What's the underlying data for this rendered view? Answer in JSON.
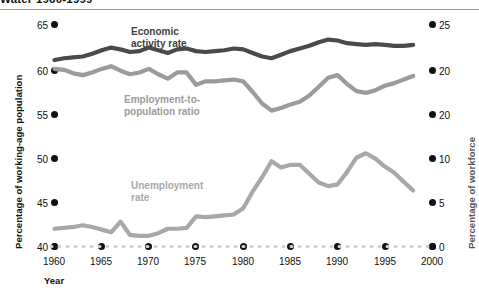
{
  "title": "Water 1960-1999",
  "axes": {
    "left_title": "Percentage of working-age population",
    "right_title": "Percentage of workforce",
    "x_title": "Year",
    "left_ticks": [
      "65",
      "60",
      "55",
      "50",
      "45",
      "40"
    ],
    "right_ticks": [
      "25",
      "20",
      "20",
      "10",
      "5",
      "0"
    ],
    "x_ticks": [
      "1960",
      "1965",
      "1970",
      "1975",
      "1980",
      "1985",
      "1990",
      "1995",
      "2000"
    ]
  },
  "series_labels": {
    "economic": "Economic\nactivity rate",
    "employment": "Employment-to-\npopulation ratio",
    "unemployment": "Unemployment\nrate"
  },
  "colors": {
    "economic": "#4a4a4a",
    "employment": "#9b9b9b",
    "unemployment": "#a8a8a8",
    "baseline_dots": "#cfcfcf",
    "tick_dot": "#111111",
    "rule": "#9a9a9a"
  },
  "chart_data": {
    "type": "line",
    "title": "Water 1960-1999",
    "xlabel": "Year",
    "ylabel": "Percentage of working-age population",
    "y2label": "Percentage of workforce",
    "xlim": [
      1960,
      2000
    ],
    "ylim": [
      40,
      65
    ],
    "y2lim": [
      0,
      25
    ],
    "grid": false,
    "legend": "inline-labels",
    "x": [
      1960,
      1961,
      1962,
      1963,
      1964,
      1965,
      1966,
      1967,
      1968,
      1969,
      1970,
      1971,
      1972,
      1973,
      1974,
      1975,
      1976,
      1977,
      1978,
      1979,
      1980,
      1981,
      1982,
      1983,
      1984,
      1985,
      1986,
      1987,
      1988,
      1989,
      1990,
      1991,
      1992,
      1993,
      1994,
      1995,
      1996,
      1997,
      1998
    ],
    "series": [
      {
        "name": "Economic activity rate",
        "axis": "left",
        "unit": "percentage of working-age population",
        "color": "#4a4a4a",
        "values": [
          61.0,
          61.2,
          61.3,
          61.4,
          61.7,
          62.1,
          62.4,
          62.2,
          61.9,
          62.0,
          62.4,
          62.1,
          61.8,
          62.2,
          62.3,
          62.0,
          61.9,
          62.0,
          62.1,
          62.3,
          62.2,
          61.8,
          61.4,
          61.2,
          61.6,
          62.0,
          62.3,
          62.6,
          63.0,
          63.3,
          63.2,
          62.9,
          62.8,
          62.7,
          62.8,
          62.7,
          62.6,
          62.6,
          62.7
        ]
      },
      {
        "name": "Employment-to-population ratio",
        "axis": "left",
        "unit": "percentage of working-age population",
        "color": "#9b9b9b",
        "values": [
          60.0,
          59.9,
          59.5,
          59.3,
          59.6,
          60.0,
          60.3,
          59.8,
          59.4,
          59.6,
          60.0,
          59.4,
          58.9,
          59.6,
          59.6,
          58.2,
          58.6,
          58.6,
          58.7,
          58.8,
          58.6,
          57.4,
          56.1,
          55.3,
          55.6,
          56.0,
          56.3,
          57.0,
          58.0,
          59.0,
          59.3,
          58.3,
          57.5,
          57.3,
          57.6,
          58.1,
          58.4,
          58.8,
          59.2
        ]
      },
      {
        "name": "Unemployment rate",
        "axis": "right",
        "unit": "percentage of workforce",
        "color": "#a8a8a8",
        "values": [
          2.0,
          2.1,
          2.2,
          2.4,
          2.2,
          1.9,
          1.6,
          2.8,
          1.3,
          1.2,
          1.2,
          1.5,
          2.0,
          2.0,
          2.1,
          3.4,
          3.3,
          3.4,
          3.5,
          3.6,
          4.3,
          6.2,
          7.8,
          9.6,
          8.9,
          9.2,
          9.2,
          8.2,
          7.2,
          6.8,
          7.0,
          8.4,
          10.0,
          10.5,
          9.9,
          9.0,
          8.3,
          7.3,
          6.3
        ]
      }
    ]
  }
}
